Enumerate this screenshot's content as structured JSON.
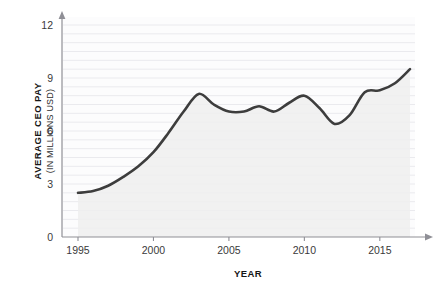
{
  "chart_data": {
    "type": "line",
    "title": "",
    "subtitle": "",
    "xlabel": "YEAR",
    "ylabel": "AVERAGE CEO PAY",
    "ylabel_sub": "(IN MILLIONS USD)",
    "xlim": [
      1995,
      2017
    ],
    "ylim": [
      0,
      12
    ],
    "xticks": [
      1995,
      2000,
      2005,
      2010,
      2015
    ],
    "xtick_labels": [
      "1995",
      "2000",
      "2005",
      "2010",
      "2015"
    ],
    "yticks": [
      0,
      3,
      6,
      9,
      12
    ],
    "ytick_labels": [
      "0",
      "3",
      "6",
      "9",
      "12"
    ],
    "grid": "horizontal-minor-0.5",
    "legend": "none",
    "area_fill": true,
    "series": [
      {
        "name": "Average CEO pay",
        "x": [
          1995,
          1996,
          1997,
          1998,
          1999,
          2000,
          2001,
          2002,
          2003,
          2004,
          2005,
          2006,
          2007,
          2008,
          2009,
          2010,
          2011,
          2012,
          2013,
          2014,
          2015,
          2016,
          2017
        ],
        "values": [
          2.5,
          2.6,
          2.9,
          3.4,
          4.0,
          4.8,
          5.9,
          7.1,
          8.1,
          7.5,
          7.1,
          7.1,
          7.4,
          7.1,
          7.6,
          8.0,
          7.3,
          6.4,
          6.9,
          8.2,
          8.3,
          8.7,
          9.5
        ]
      }
    ],
    "colors": {
      "line": "#3d3d3d",
      "area": "#eeeeee",
      "grid": "#eaeaee",
      "axis": "#8f8f96",
      "text": "#1a1a1a",
      "background": "#ffffff"
    }
  },
  "axes": {
    "y_title_line1": "AVERAGE CEO PAY",
    "y_title_line2": "(IN MILLIONS USD)",
    "x_title": "YEAR"
  }
}
